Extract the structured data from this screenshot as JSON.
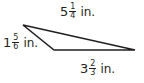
{
  "diagram": {
    "type": "triangle",
    "stroke_color": "#231f20",
    "vertices": {
      "top_left": [
        23,
        25
      ],
      "bottom_left": [
        54,
        50
      ],
      "right": [
        135,
        50
      ]
    },
    "sides": [
      {
        "id": "top",
        "whole": "5",
        "numerator": "1",
        "denominator": "4",
        "unit": "in."
      },
      {
        "id": "left",
        "whole": "1",
        "numerator": "5",
        "denominator": "6",
        "unit": "in."
      },
      {
        "id": "bottom",
        "whole": "3",
        "numerator": "2",
        "denominator": "3",
        "unit": "in."
      }
    ]
  }
}
